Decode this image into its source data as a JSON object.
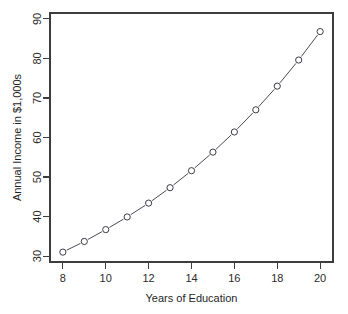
{
  "chart_data": {
    "type": "line",
    "title": "",
    "subtitle": "",
    "xlabel": "Years of Education",
    "ylabel": "Annual Income in $1,000s",
    "x": [
      8,
      9,
      10,
      11,
      12,
      13,
      14,
      15,
      16,
      17,
      18,
      19,
      20
    ],
    "values": [
      31.0,
      33.7,
      36.7,
      39.9,
      43.4,
      47.3,
      51.6,
      56.3,
      61.4,
      67.0,
      73.0,
      79.6,
      86.8
    ],
    "series": [
      {
        "name": "Annual Income",
        "values": [
          31.0,
          33.7,
          36.7,
          39.9,
          43.4,
          47.3,
          51.6,
          56.3,
          61.4,
          67.0,
          73.0,
          79.6,
          86.8
        ]
      }
    ],
    "xlim": [
      7.4,
      20.6
    ],
    "ylim": [
      28.5,
      91.5
    ],
    "xticks": [
      8,
      10,
      12,
      14,
      16,
      18,
      20
    ],
    "yticks": [
      30,
      40,
      50,
      60,
      70,
      80,
      90
    ],
    "xtick_labels": [
      "8",
      "10",
      "12",
      "14",
      "16",
      "18",
      "20"
    ],
    "ytick_labels": [
      "30",
      "40",
      "50",
      "60",
      "70",
      "80",
      "90"
    ],
    "grid": false,
    "legend": false,
    "legend_position": "none",
    "marker": "open-circle",
    "line_color": "#4a4a58",
    "marker_fill": "#ffffff",
    "marker_stroke": "#3a3a46",
    "axis_color": "#3d3d3d",
    "background": "#ffffff",
    "annotations": []
  }
}
